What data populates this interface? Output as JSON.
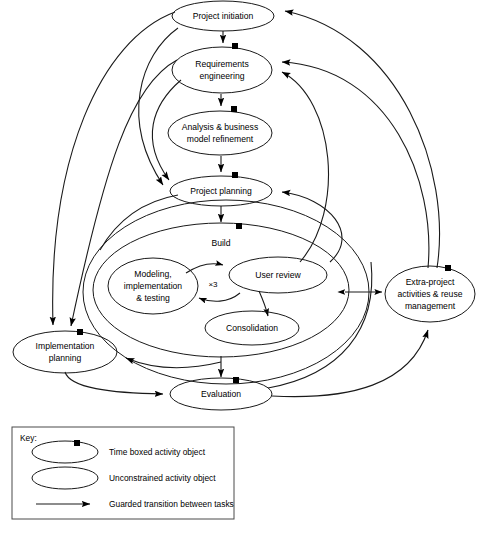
{
  "diagram": {
    "nodes": [
      {
        "id": "project_initiation",
        "label": "Project initiation",
        "timeboxed": false
      },
      {
        "id": "requirements",
        "label_line1": "Requirements",
        "label_line2": "engineering",
        "timeboxed": true
      },
      {
        "id": "analysis",
        "label_line1": "Analysis & business",
        "label_line2": "model refinement",
        "timeboxed": true
      },
      {
        "id": "project_planning",
        "label": "Project planning",
        "timeboxed": true
      },
      {
        "id": "build_outer",
        "label": "",
        "timeboxed": false
      },
      {
        "id": "build",
        "label": "Build",
        "timeboxed": true
      },
      {
        "id": "modeling",
        "label_line1": "Modeling,",
        "label_line2": "implementation",
        "label_line3": "& testing",
        "timeboxed": false
      },
      {
        "id": "user_review",
        "label": "User review",
        "timeboxed": false
      },
      {
        "id": "consolidation",
        "label": "Consolidation",
        "timeboxed": false
      },
      {
        "id": "implementation_plan",
        "label_line1": "Implementation",
        "label_line2": "planning",
        "timeboxed": true
      },
      {
        "id": "evaluation",
        "label": "Evaluation",
        "timeboxed": true
      },
      {
        "id": "extra_project",
        "label_line1": "Extra-project",
        "label_line2": "activities & reuse",
        "label_line3": "management",
        "timeboxed": true
      }
    ],
    "annotations": [
      {
        "id": "build_iteration_multiplicity",
        "text": "×3"
      }
    ],
    "key": {
      "title": "Key:",
      "entries": [
        {
          "symbol": "timeboxed-ellipse",
          "label": "Time boxed activity object"
        },
        {
          "symbol": "plain-ellipse",
          "label": "Unconstrained activity object"
        },
        {
          "symbol": "arrow",
          "label": "Guarded transition between tasks"
        }
      ]
    },
    "colors": {
      "stroke": "#1a1a1a",
      "fill": "#ffffff",
      "timebox_marker": "#000000",
      "key_border": "#4a4a4a"
    }
  }
}
